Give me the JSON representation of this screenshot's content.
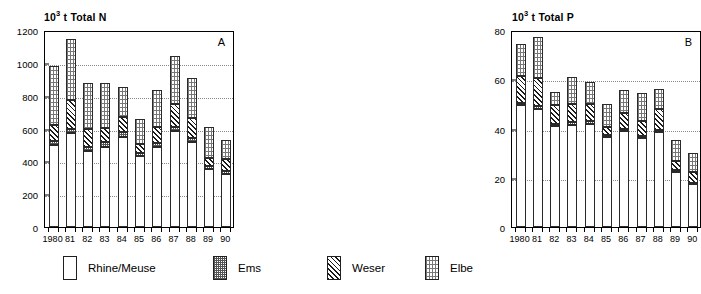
{
  "chart_data": [
    {
      "type": "bar",
      "panel_letter": "A",
      "title": "10³ t  Total N",
      "title_prefix": "10",
      "title_exponent": "3",
      "title_suffix": "t  Total N",
      "stacked": true,
      "xlabel": "",
      "ylabel": "",
      "ylim": [
        0,
        1200
      ],
      "yticks": [
        0,
        200,
        400,
        600,
        800,
        1000,
        1200
      ],
      "grid": true,
      "grid_axis": "y",
      "legend_position": "bottom",
      "categories": [
        "1980",
        "81",
        "82",
        "83",
        "84",
        "85",
        "86",
        "87",
        "88",
        "89",
        "90"
      ],
      "series": [
        {
          "name": "Rhine/Meuse",
          "fill": "white",
          "values": [
            500,
            570,
            465,
            490,
            550,
            430,
            485,
            585,
            520,
            355,
            325
          ]
        },
        {
          "name": "Ems",
          "fill": "fine-stipple",
          "values": [
            25,
            30,
            25,
            25,
            30,
            20,
            25,
            25,
            25,
            15,
            15
          ]
        },
        {
          "name": "Weser",
          "fill": "diagonal-hatch",
          "values": [
            95,
            175,
            110,
            90,
            90,
            55,
            100,
            140,
            120,
            50,
            75
          ]
        },
        {
          "name": "Elbe",
          "fill": "light-dots",
          "values": [
            360,
            370,
            275,
            275,
            180,
            155,
            225,
            290,
            240,
            190,
            115
          ]
        }
      ],
      "totals": [
        980,
        1145,
        875,
        880,
        850,
        660,
        835,
        1040,
        905,
        610,
        530
      ]
    },
    {
      "type": "bar",
      "panel_letter": "B",
      "title": "10³ t  Total P",
      "title_prefix": "10",
      "title_exponent": "3",
      "title_suffix": "t  Total P",
      "stacked": true,
      "xlabel": "",
      "ylabel": "",
      "ylim": [
        0,
        80
      ],
      "yticks": [
        0,
        20,
        40,
        60,
        80
      ],
      "grid": true,
      "grid_axis": "y",
      "legend_position": "bottom",
      "categories": [
        "1980",
        "81",
        "82",
        "83",
        "84",
        "85",
        "86",
        "87",
        "88",
        "89",
        "90"
      ],
      "series": [
        {
          "name": "Rhine/Meuse",
          "fill": "white",
          "values": [
            49.5,
            48.0,
            41.0,
            41.5,
            42.0,
            36.5,
            39.0,
            36.0,
            38.5,
            22.5,
            17.5
          ]
        },
        {
          "name": "Ems",
          "fill": "fine-stipple",
          "values": [
            1.0,
            1.0,
            1.0,
            1.0,
            1.0,
            1.0,
            1.0,
            1.0,
            1.0,
            0.5,
            0.5
          ]
        },
        {
          "name": "Weser",
          "fill": "diagonal-hatch",
          "values": [
            11.0,
            11.5,
            7.5,
            7.5,
            7.0,
            3.0,
            6.5,
            6.0,
            8.5,
            4.0,
            4.5
          ]
        },
        {
          "name": "Elbe",
          "fill": "light-dots",
          "values": [
            13.0,
            16.5,
            5.5,
            11.0,
            9.0,
            9.5,
            9.0,
            11.5,
            8.0,
            8.5,
            7.5
          ]
        }
      ],
      "totals": [
        74.5,
        77.0,
        55.0,
        61.0,
        59.0,
        50.0,
        55.5,
        54.5,
        56.0,
        35.5,
        30.0
      ]
    }
  ],
  "legend": {
    "items": [
      {
        "label": "Rhine/Meuse",
        "fill": "white"
      },
      {
        "label": "Ems",
        "fill": "fine-stipple"
      },
      {
        "label": "Weser",
        "fill": "diagonal-hatch"
      },
      {
        "label": "Elbe",
        "fill": "light-dots"
      }
    ]
  }
}
